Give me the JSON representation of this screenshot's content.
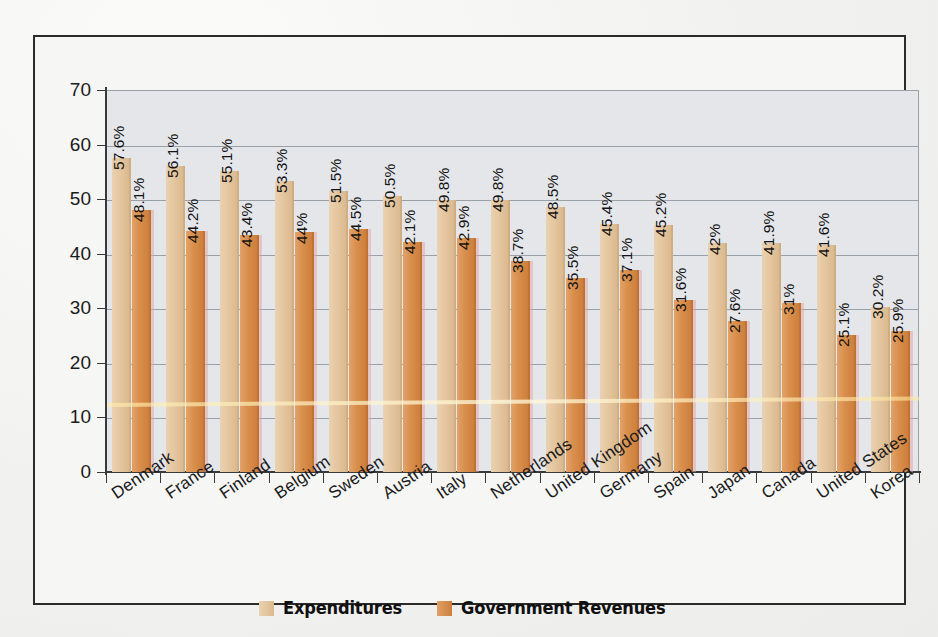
{
  "chart_data": {
    "type": "bar",
    "title": "",
    "xlabel": "",
    "ylabel": "",
    "ylim": [
      0,
      70
    ],
    "ytick_step": 10,
    "yticks": [
      0,
      10,
      20,
      30,
      40,
      50,
      60,
      70
    ],
    "grid": true,
    "legend_position": "bottom-center",
    "categories": [
      "Denmark",
      "France",
      "Finland",
      "Belgium",
      "Sweden",
      "Austria",
      "Italy",
      "Netherlands",
      "United Kingdom",
      "Germany",
      "Spain",
      "Japan",
      "Canada",
      "United States",
      "Korea"
    ],
    "series": [
      {
        "name": "Expenditures",
        "color": "#e2c193",
        "values": [
          57.6,
          56.1,
          55.1,
          53.3,
          51.5,
          50.5,
          49.8,
          49.8,
          48.5,
          45.4,
          45.2,
          42,
          41.9,
          41.6,
          30.2
        ],
        "labels": [
          "57.6%",
          "56.1%",
          "55.1%",
          "53.3%",
          "51.5%",
          "50.5%",
          "49.8%",
          "49.8%",
          "48.5%",
          "45.4%",
          "45.2%",
          "42%",
          "41.9%",
          "41.6%",
          "30.2%"
        ]
      },
      {
        "name": "Government Revenues",
        "color": "#d4853f",
        "values": [
          48.1,
          44.2,
          43.4,
          44,
          44.5,
          42.1,
          42.9,
          38.7,
          35.5,
          37.1,
          31.6,
          27.6,
          31,
          25.1,
          25.9
        ],
        "labels": [
          "48.1%",
          "44.2%",
          "43.4%",
          "44%",
          "44.5%",
          "42.1%",
          "42.9%",
          "38.7%",
          "35.5%",
          "37.1%",
          "31.6%",
          "27.6%",
          "31%",
          "25.1%",
          "25.9%"
        ]
      }
    ]
  },
  "legend": {
    "items": [
      {
        "label": "Expenditures",
        "swatch": "expenditures-swatch"
      },
      {
        "label": "Government Revenues",
        "swatch": "government-revenues-swatch"
      }
    ]
  }
}
